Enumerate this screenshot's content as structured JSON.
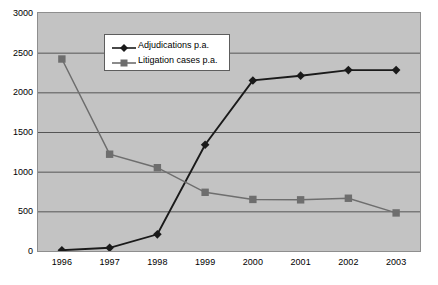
{
  "chart_data": {
    "type": "line",
    "title": "",
    "xlabel": "",
    "ylabel": "",
    "categories": [
      "1996",
      "1997",
      "1998",
      "1999",
      "2000",
      "2001",
      "2002",
      "2003"
    ],
    "ylim": [
      0,
      3000
    ],
    "yticks": [
      "0",
      "500",
      "1000",
      "1500",
      "2000",
      "2500",
      "3000"
    ],
    "ytick_values": [
      0,
      500,
      1000,
      1500,
      2000,
      2500,
      3000
    ],
    "grid": true,
    "legend_position": "top-center",
    "series": [
      {
        "name": "Adjudications p.a.",
        "values": [
          10,
          40,
          210,
          1340,
          2150,
          2210,
          2280,
          2280
        ],
        "color": "#1a1a1a",
        "marker": "diamond"
      },
      {
        "name": "Litigation cases p.a.",
        "values": [
          2420,
          1220,
          1050,
          740,
          650,
          645,
          665,
          480
        ],
        "color": "#6e6e6e",
        "marker": "square"
      }
    ]
  },
  "legend": {
    "entries": [
      {
        "label": "Adjudications p.a."
      },
      {
        "label": "Litigation cases p.a."
      }
    ]
  },
  "colors": {
    "plot_background": "#c3c3c3",
    "page_background": "#ffffff",
    "gridline": "#555555",
    "axis": "#3b3b3b",
    "series_adjudications": "#1a1a1a",
    "series_litigation": "#6e6e6e"
  }
}
